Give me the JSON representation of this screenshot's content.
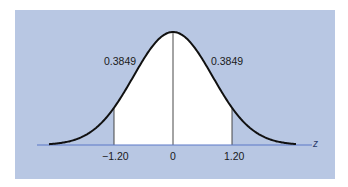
{
  "chart_data": {
    "type": "area",
    "title": "",
    "xlabel": "z",
    "ylabel": "",
    "distribution": "standard normal",
    "x_ticks": [
      -1.2,
      0,
      1.2
    ],
    "x_tick_labels": [
      "−1.20",
      "0",
      "1.20"
    ],
    "shaded_regions": [
      {
        "from": -1.2,
        "to": 0,
        "area": 0.3849,
        "label": "0.3849"
      },
      {
        "from": 0,
        "to": 1.2,
        "area": 0.3849,
        "label": "0.3849"
      }
    ],
    "annotations": [
      "0.3849",
      "0.3849"
    ],
    "grid": false,
    "legend": null
  },
  "labels": {
    "area_left": "0.3849",
    "area_right": "0.3849",
    "tick_neg": "−1.20",
    "tick_zero": "0",
    "tick_pos": "1.20",
    "axis_var": "z"
  },
  "colors": {
    "background": "#b8c7e3",
    "shaded_fill": "#ffffff",
    "curve": "#111111",
    "axis": "#5a78c8"
  }
}
